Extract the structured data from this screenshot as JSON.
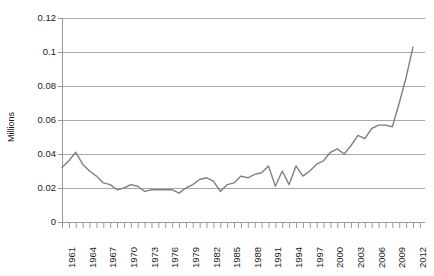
{
  "chart_data": {
    "type": "line",
    "title": "",
    "subtitle": "",
    "xlabel": "",
    "ylabel": "Millions",
    "xlim": [
      1961,
      2012
    ],
    "ylim": [
      0,
      0.12
    ],
    "grid": true,
    "legend": false,
    "legend_position": "none",
    "line_color": "#808080",
    "ytick_labels": [
      "0.12",
      "0.1",
      "0.08",
      "0.06",
      "0.04",
      "0.02",
      "0"
    ],
    "ytick_values": [
      0.12,
      0.1,
      0.08,
      0.06,
      0.04,
      0.02,
      0
    ],
    "xtick_labels": [
      "1961",
      "1964",
      "1967",
      "1970",
      "1973",
      "1976",
      "1979",
      "1982",
      "1985",
      "1988",
      "1991",
      "1994",
      "1997",
      "2000",
      "2003",
      "2006",
      "2009",
      "2012"
    ],
    "xtick_values": [
      1961,
      1964,
      1967,
      1970,
      1973,
      1976,
      1979,
      1982,
      1985,
      1988,
      1991,
      1994,
      1997,
      2000,
      2003,
      2006,
      2009,
      2012
    ],
    "x": [
      1961,
      1962,
      1963,
      1964,
      1965,
      1966,
      1967,
      1968,
      1969,
      1970,
      1971,
      1972,
      1973,
      1974,
      1975,
      1976,
      1977,
      1978,
      1979,
      1980,
      1981,
      1982,
      1983,
      1984,
      1985,
      1986,
      1987,
      1988,
      1989,
      1990,
      1991,
      1992,
      1993,
      1994,
      1995,
      1996,
      1997,
      1998,
      1999,
      2000,
      2001,
      2002,
      2003,
      2004,
      2005,
      2006,
      2007,
      2008,
      2009,
      2010,
      2011,
      2012
    ],
    "values": [
      0.032,
      0.036,
      0.041,
      0.034,
      0.03,
      0.027,
      0.023,
      0.022,
      0.019,
      0.02,
      0.022,
      0.021,
      0.018,
      0.019,
      0.019,
      0.019,
      0.019,
      0.017,
      0.02,
      0.022,
      0.025,
      0.026,
      0.024,
      0.018,
      0.022,
      0.023,
      0.027,
      0.026,
      0.028,
      0.029,
      0.033,
      0.021,
      0.03,
      0.022,
      0.033,
      0.027,
      0.03,
      0.034,
      0.036,
      0.041,
      0.043,
      0.04,
      0.045,
      0.051,
      0.049,
      0.055,
      0.057,
      0.057,
      0.056,
      0.07,
      0.085,
      0.103
    ]
  }
}
